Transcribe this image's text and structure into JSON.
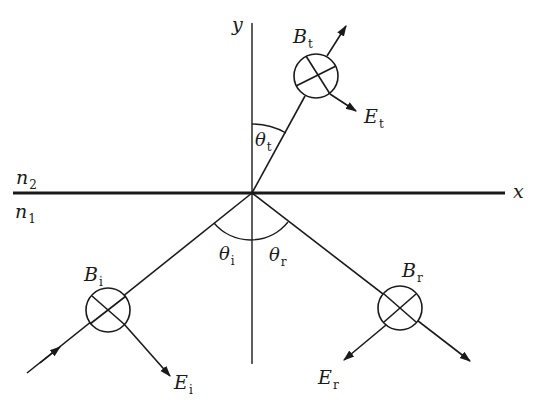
{
  "diagram": {
    "colors": {
      "ink": "#1a1a1a",
      "background": "#ffffff"
    },
    "axes": {
      "x_label": "x",
      "y_label": "y"
    },
    "media": {
      "upper": {
        "symbol": "n",
        "sub": "2"
      },
      "lower": {
        "symbol": "n",
        "sub": "1"
      }
    },
    "angles": {
      "incident": {
        "symbol": "θ",
        "sub": "i"
      },
      "reflected": {
        "symbol": "θ",
        "sub": "r"
      },
      "transmitted": {
        "symbol": "θ",
        "sub": "t"
      }
    },
    "fields": {
      "B_incident": {
        "symbol": "B",
        "sub": "i"
      },
      "E_incident": {
        "symbol": "E",
        "sub": "i"
      },
      "B_reflected": {
        "symbol": "B",
        "sub": "r"
      },
      "E_reflected": {
        "symbol": "E",
        "sub": "r"
      },
      "B_transmitted": {
        "symbol": "B",
        "sub": "t"
      },
      "E_transmitted": {
        "symbol": "E",
        "sub": "t"
      }
    },
    "notes": {
      "B_direction": "into page (⊗)"
    }
  }
}
